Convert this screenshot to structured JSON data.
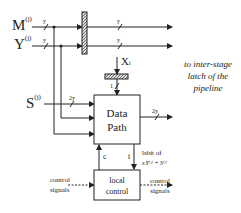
{
  "diagram": {
    "inputs": {
      "m": {
        "base": "M",
        "sup": "(j)"
      },
      "y": {
        "base": "Y",
        "sup": "(j)"
      },
      "s": {
        "base": "S",
        "sup": "(j)"
      },
      "x": {
        "base": "X",
        "sub": "i"
      }
    },
    "bus_labels": {
      "m_in": "y",
      "y_in": "y",
      "m_out": "y",
      "y_out": "y",
      "s_in": "2y",
      "x_in": "1",
      "dp_out": "2y"
    },
    "blocks": {
      "data_path": {
        "line1": "Data",
        "line2": "Path"
      },
      "local_control": {
        "line1": "local",
        "line2": "control"
      }
    },
    "signals": {
      "c": "c",
      "t": "t",
      "lsbit_line1": "lsbit of",
      "lsbit_line2": "xᵢY⁽ʲ⁾ + S⁽ʲ⁾",
      "control_in_1": "control",
      "control_in_2": "signals",
      "control_out_1": "control",
      "control_out_2": "signals"
    },
    "note": {
      "line1": "to inter-stage",
      "line2": "latch of the",
      "line3": "pipeline"
    }
  }
}
